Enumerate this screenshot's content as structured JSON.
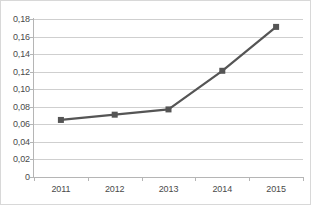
{
  "chart_data": {
    "type": "line",
    "title": "",
    "subtitle": "",
    "xlabel": "",
    "ylabel": "",
    "categories": [
      "2011",
      "2012",
      "2013",
      "2014",
      "2015"
    ],
    "series": [
      {
        "name": "Series 1",
        "values": [
          0.065,
          0.071,
          0.077,
          0.121,
          0.171
        ],
        "color": "#555555",
        "marker": "square"
      }
    ],
    "ylim": [
      0,
      0.18
    ],
    "ytick_values": [
      0,
      0.02,
      0.04,
      0.06,
      0.08,
      0.1,
      0.12,
      0.14,
      0.16,
      0.18
    ],
    "ytick_labels": [
      "0",
      "0,02",
      "0,04",
      "0,06",
      "0,08",
      "0,10",
      "0,12",
      "0,14",
      "0,16",
      "0,18"
    ],
    "grid": {
      "horizontal": true,
      "vertical": false,
      "color": "#cfcfcf"
    },
    "legend": {
      "visible": false,
      "position": "none"
    },
    "axis_color": "#b5b5b5",
    "background_color": "#ffffff",
    "border_color": "#d8d8d8"
  }
}
